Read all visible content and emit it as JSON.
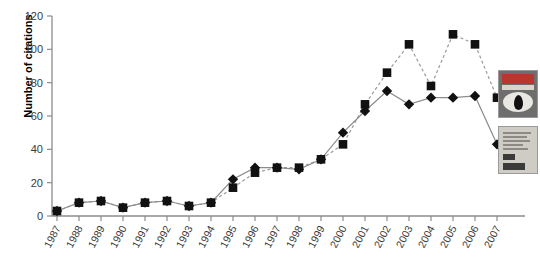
{
  "figure": {
    "background": "#ffffff",
    "axis_color": "#8c8c8c",
    "marker_color": "#111111",
    "series_a_line": "#8c8c8c",
    "series_b_line": "#9a9a9a"
  },
  "axes": {
    "ylabel": "Number of citations",
    "yticks": [
      "0",
      "20",
      "40",
      "60",
      "80",
      "100",
      "120"
    ],
    "xlabel": ""
  },
  "thumbnails": [
    {
      "name": "journal-cover-biology-of-reproduction",
      "alt": "Biology of Reproduction journal cover"
    },
    {
      "name": "journal-cover-article-reprint",
      "alt": "Article reprint first page"
    }
  ],
  "chart_data": {
    "type": "line",
    "title": "",
    "xlabel": "",
    "ylabel": "Number of citations",
    "ylim": [
      0,
      120
    ],
    "yticks": [
      0,
      20,
      40,
      60,
      80,
      100,
      120
    ],
    "grid": false,
    "legend": "none",
    "categories": [
      "1987",
      "1988",
      "1989",
      "1990",
      "1991",
      "1992",
      "1993",
      "1994",
      "1995",
      "1996",
      "1997",
      "1998",
      "1999",
      "2000",
      "2001",
      "2002",
      "2003",
      "2004",
      "2005",
      "2006",
      "2007"
    ],
    "series": [
      {
        "name": "Series 1 (diamond, solid line)",
        "marker": "diamond",
        "linestyle": "solid",
        "values": [
          3,
          8,
          9,
          5,
          8,
          9,
          6,
          8,
          22,
          29,
          29,
          28,
          34,
          50,
          63,
          75,
          67,
          71,
          71,
          72,
          43
        ]
      },
      {
        "name": "Series 2 (square, dashed line)",
        "marker": "square",
        "linestyle": "dashed",
        "values": [
          3,
          8,
          9,
          5,
          8,
          9,
          6,
          8,
          17,
          26,
          29,
          29,
          34,
          43,
          67,
          86,
          103,
          78,
          109,
          103,
          71
        ]
      }
    ]
  }
}
